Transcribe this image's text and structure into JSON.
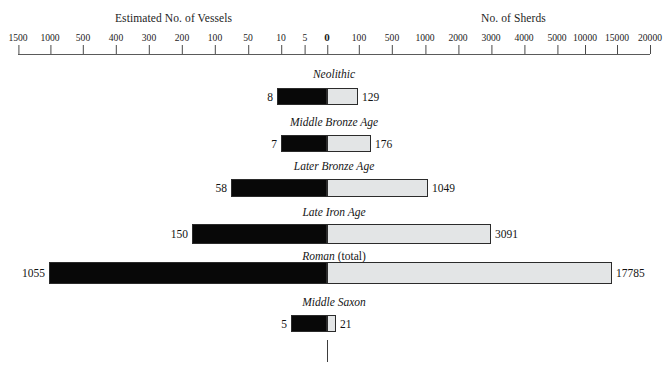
{
  "chart_data": {
    "type": "bar",
    "title": "",
    "subtitle": "",
    "orientation": "horizontal-diverging",
    "axis_titles": {
      "left": "Estimated No. of Vessels",
      "right": "No. of Sherds"
    },
    "axis_ticks_left": [
      "1500",
      "1000",
      "500",
      "400",
      "300",
      "200",
      "100",
      "50",
      "10",
      "5"
    ],
    "axis_ticks_center": "0",
    "axis_ticks_right": [
      "100",
      "500",
      "1000",
      "2000",
      "3000",
      "4000",
      "5000",
      "10000",
      "15000",
      "20000"
    ],
    "grid": false,
    "legend": "none",
    "categories": [
      "Neolithic",
      "Middle Bronze Age",
      "Later Bronze Age",
      "Late Iron Age",
      "Roman (total)",
      "Middle Saxon"
    ],
    "series": [
      {
        "name": "Estimated No. of Vessels",
        "values": [
          8,
          7,
          58,
          150,
          1055,
          5
        ]
      },
      {
        "name": "No. of Sherds",
        "values": [
          129,
          176,
          1049,
          3091,
          17785,
          21
        ]
      }
    ]
  },
  "header": {
    "left_title": "Estimated No. of Vessels",
    "right_title": "No. of Sherds"
  },
  "axis": {
    "ticks": [
      {
        "label": "1500",
        "x": 18
      },
      {
        "label": "1000",
        "x": 50
      },
      {
        "label": "500",
        "x": 83
      },
      {
        "label": "400",
        "x": 116
      },
      {
        "label": "300",
        "x": 149
      },
      {
        "label": "200",
        "x": 182
      },
      {
        "label": "100",
        "x": 215
      },
      {
        "label": "50",
        "x": 248
      },
      {
        "label": "10",
        "x": 281
      },
      {
        "label": "5",
        "x": 305
      },
      {
        "label": "0",
        "x": 327
      },
      {
        "label": "100",
        "x": 359
      },
      {
        "label": "500",
        "x": 392
      },
      {
        "label": "1000",
        "x": 425
      },
      {
        "label": "2000",
        "x": 458
      },
      {
        "label": "3000",
        "x": 491
      },
      {
        "label": "4000",
        "x": 524
      },
      {
        "label": "5000",
        "x": 557
      },
      {
        "label": "10000",
        "x": 585
      },
      {
        "label": "15000",
        "x": 617
      },
      {
        "label": "20000",
        "x": 650
      }
    ]
  },
  "rows": [
    {
      "key": "neolithic",
      "label": "Neolithic",
      "label_suffix": "",
      "label_top": 68,
      "bar_top": 88,
      "bar_height": 17,
      "vessels_value": "8",
      "sherds_value": "129",
      "vessels_left": 277,
      "vessels_width": 50,
      "sherds_left": 327,
      "sherds_width": 31
    },
    {
      "key": "middle-bronze-age",
      "label": "Middle Bronze Age",
      "label_suffix": "",
      "label_top": 116,
      "bar_top": 135,
      "bar_height": 17,
      "vessels_value": "7",
      "sherds_value": "176",
      "vessels_left": 281,
      "vessels_width": 46,
      "sherds_left": 327,
      "sherds_width": 44
    },
    {
      "key": "later-bronze-age",
      "label": "Later Bronze Age",
      "label_suffix": "",
      "label_top": 160,
      "bar_top": 179,
      "bar_height": 18,
      "vessels_value": "58",
      "sherds_value": "1049",
      "vessels_left": 231,
      "vessels_width": 96,
      "sherds_left": 327,
      "sherds_width": 101
    },
    {
      "key": "late-iron-age",
      "label": "Late Iron Age",
      "label_suffix": "",
      "label_top": 206,
      "bar_top": 224,
      "bar_height": 20,
      "vessels_value": "150",
      "sherds_value": "3091",
      "vessels_left": 192,
      "vessels_width": 135,
      "sherds_left": 327,
      "sherds_width": 164
    },
    {
      "key": "roman-total",
      "label": "Roman",
      "label_suffix": " (total)",
      "label_top": 250,
      "bar_top": 262,
      "bar_height": 22,
      "vessels_value": "1055",
      "sherds_value": "17785",
      "vessels_left": 49,
      "vessels_width": 278,
      "sherds_left": 327,
      "sherds_width": 285
    },
    {
      "key": "middle-saxon",
      "label": "Middle Saxon",
      "label_suffix": "",
      "label_top": 296,
      "bar_top": 315,
      "bar_height": 17,
      "vessels_value": "5",
      "sherds_value": "21",
      "vessels_left": 291,
      "vessels_width": 36,
      "sherds_left": 327,
      "sherds_width": 9
    }
  ],
  "center_tick": {
    "x": 327,
    "y": 340,
    "height": 22
  },
  "colors": {
    "vessels_fill": "#080808",
    "sherds_fill": "#e3e5e6",
    "bar_stroke": "#2b2b2b",
    "axis_line": "#5a5a5a",
    "text": "#1a1a1a",
    "background": "#ffffff"
  }
}
